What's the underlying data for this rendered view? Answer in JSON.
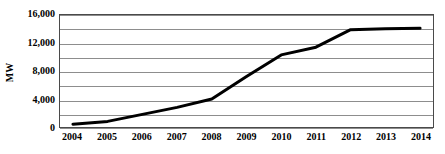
{
  "chart_data": {
    "type": "line",
    "title": "",
    "xlabel": "",
    "ylabel": "MW",
    "categories": [
      "2004",
      "2005",
      "2006",
      "2007",
      "2008",
      "2009",
      "2010",
      "2011",
      "2012",
      "2013",
      "2014"
    ],
    "x": [
      2004,
      2005,
      2006,
      2007,
      2008,
      2009,
      2010,
      2011,
      2012,
      2013,
      2014
    ],
    "values": [
      400,
      800,
      1800,
      2800,
      4000,
      7200,
      10300,
      11400,
      13900,
      14050,
      14100
    ],
    "series": [
      {
        "name": "Installed capacity",
        "values": [
          400,
          800,
          1800,
          2800,
          4000,
          7200,
          10300,
          11400,
          13900,
          14050,
          14100
        ],
        "color": "#000000",
        "line_width": 3
      }
    ],
    "ylim": [
      0,
      16000
    ],
    "xlim": [
      2004,
      2014
    ],
    "y_tick_labels": [
      "0",
      "4,000",
      "8,000",
      "12,000",
      "16,000"
    ],
    "y_tick_values": [
      0,
      4000,
      8000,
      12000,
      16000
    ],
    "gridline_values": [
      0,
      2000,
      4000,
      6000,
      8000,
      10000,
      12000,
      14000,
      16000
    ],
    "grid": true,
    "grid_color": "#8d8d8d",
    "legend": false,
    "legend_position": "none",
    "plot_border_color": "#4a4a4a",
    "background_color": "#ffffff"
  },
  "axes": {
    "y_title": "MW",
    "y_ticks": [
      {
        "label": "16,000",
        "value": 16000
      },
      {
        "label": "12,000",
        "value": 12000
      },
      {
        "label": "8,000",
        "value": 8000
      },
      {
        "label": "4,000",
        "value": 4000
      },
      {
        "label": "0",
        "value": 0
      }
    ],
    "x_ticks": [
      {
        "label": "2004",
        "value": 2004
      },
      {
        "label": "2005",
        "value": 2005
      },
      {
        "label": "2006",
        "value": 2006
      },
      {
        "label": "2007",
        "value": 2007
      },
      {
        "label": "2008",
        "value": 2008
      },
      {
        "label": "2009",
        "value": 2009
      },
      {
        "label": "2010",
        "value": 2010
      },
      {
        "label": "2011",
        "value": 2011
      },
      {
        "label": "2012",
        "value": 2012
      },
      {
        "label": "2013",
        "value": 2013
      },
      {
        "label": "2014",
        "value": 2014
      }
    ]
  }
}
